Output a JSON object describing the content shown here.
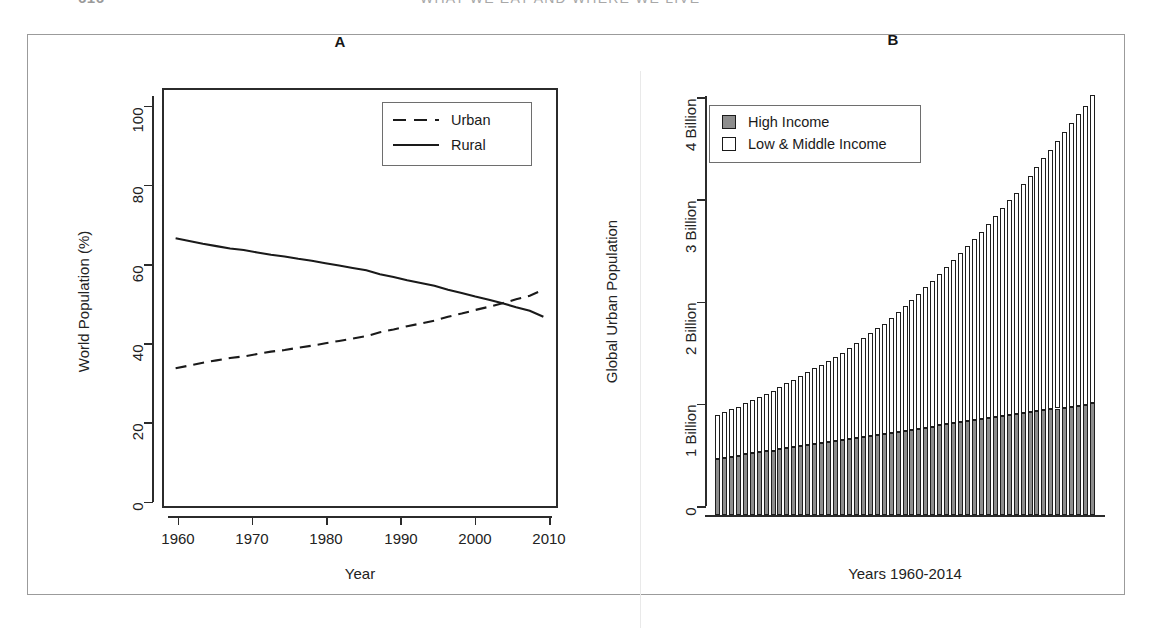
{
  "page_header": {
    "folio": "616",
    "running_title": "WHAT WE EAT AND WHERE WE LIVE"
  },
  "figure": {
    "panels": [
      {
        "id": "A",
        "title": "A",
        "xlabel": "Year",
        "ylabel": "World Population (%)"
      },
      {
        "id": "B",
        "title": "B",
        "xlabel": "Years 1960-2014",
        "ylabel": "Global Urban Population"
      }
    ]
  },
  "chart_data": [
    {
      "type": "line",
      "panel": "A",
      "title": "A",
      "xlabel": "Year",
      "ylabel": "World Population (%)",
      "xlim": [
        1958,
        2016
      ],
      "ylim": [
        0,
        104
      ],
      "xticks": [
        1960,
        1970,
        1980,
        1990,
        2000,
        2010
      ],
      "yticks": [
        0,
        20,
        40,
        60,
        80,
        100
      ],
      "grid": false,
      "legend_position": "top-right",
      "legend": [
        "Urban",
        "Rural"
      ],
      "x": [
        1960,
        1962,
        1964,
        1966,
        1968,
        1970,
        1972,
        1974,
        1976,
        1978,
        1980,
        1982,
        1984,
        1986,
        1988,
        1990,
        1992,
        1994,
        1996,
        1998,
        2000,
        2002,
        2004,
        2006,
        2008,
        2010,
        2012,
        2014
      ],
      "series": [
        {
          "name": "Urban",
          "style": "dashed",
          "values": [
            33.6,
            34.3,
            35.0,
            35.6,
            36.2,
            36.6,
            37.2,
            37.8,
            38.2,
            38.8,
            39.3,
            39.9,
            40.5,
            41.1,
            41.7,
            42.7,
            43.4,
            44.2,
            44.9,
            45.6,
            46.6,
            47.4,
            48.3,
            49.1,
            50.0,
            51.0,
            51.9,
            53.4
          ]
        },
        {
          "name": "Rural",
          "style": "solid",
          "values": [
            66.4,
            65.7,
            65.0,
            64.4,
            63.8,
            63.4,
            62.8,
            62.2,
            61.8,
            61.2,
            60.7,
            60.1,
            59.5,
            58.9,
            58.3,
            57.3,
            56.6,
            55.8,
            55.1,
            54.4,
            53.4,
            52.6,
            51.7,
            50.9,
            50.0,
            49.0,
            48.1,
            46.6
          ]
        }
      ],
      "crossover": {
        "year": 2007,
        "value": 50.0
      }
    },
    {
      "type": "bar",
      "subtype": "stacked",
      "panel": "B",
      "title": "B",
      "xlabel": "Years 1960-2014",
      "ylabel": "Global Urban Population",
      "ylim": [
        0,
        4.35
      ],
      "yticks": [
        0,
        1,
        2,
        3,
        4
      ],
      "ytick_labels": [
        "0",
        "1 Billion",
        "2 Billion",
        "3 Billion",
        "4 Billion"
      ],
      "grid": false,
      "legend_position": "top-left",
      "categories": [
        1960,
        1961,
        1962,
        1963,
        1964,
        1965,
        1966,
        1967,
        1968,
        1969,
        1970,
        1971,
        1972,
        1973,
        1974,
        1975,
        1976,
        1977,
        1978,
        1979,
        1980,
        1981,
        1982,
        1983,
        1984,
        1985,
        1986,
        1987,
        1988,
        1989,
        1990,
        1991,
        1992,
        1993,
        1994,
        1995,
        1996,
        1997,
        1998,
        1999,
        2000,
        2001,
        2002,
        2003,
        2004,
        2005,
        2006,
        2007,
        2008,
        2009,
        2010,
        2011,
        2012,
        2013,
        2014
      ],
      "series": [
        {
          "name": "High Income",
          "color": "#8d8d8d",
          "values": [
            0.57,
            0.58,
            0.59,
            0.6,
            0.62,
            0.63,
            0.64,
            0.65,
            0.66,
            0.68,
            0.69,
            0.7,
            0.71,
            0.72,
            0.73,
            0.74,
            0.75,
            0.76,
            0.77,
            0.78,
            0.79,
            0.8,
            0.81,
            0.82,
            0.83,
            0.84,
            0.85,
            0.86,
            0.87,
            0.88,
            0.89,
            0.9,
            0.92,
            0.93,
            0.94,
            0.95,
            0.96,
            0.97,
            0.98,
            0.99,
            1.0,
            1.01,
            1.02,
            1.03,
            1.04,
            1.05,
            1.06,
            1.07,
            1.08,
            1.09,
            1.1,
            1.11,
            1.12,
            1.13,
            1.15
          ]
        },
        {
          "name": "Low & Middle Income",
          "color": "#ffffff",
          "values": [
            0.45,
            0.47,
            0.49,
            0.51,
            0.53,
            0.55,
            0.57,
            0.59,
            0.61,
            0.63,
            0.66,
            0.68,
            0.71,
            0.74,
            0.77,
            0.8,
            0.83,
            0.86,
            0.89,
            0.93,
            0.97,
            1.01,
            1.05,
            1.09,
            1.13,
            1.18,
            1.23,
            1.28,
            1.33,
            1.38,
            1.44,
            1.49,
            1.55,
            1.61,
            1.67,
            1.73,
            1.79,
            1.86,
            1.92,
            1.99,
            2.06,
            2.13,
            2.2,
            2.27,
            2.35,
            2.42,
            2.5,
            2.58,
            2.66,
            2.74,
            2.82,
            2.9,
            2.98,
            3.06,
            3.15
          ]
        }
      ],
      "totals": [
        1.02,
        1.05,
        1.08,
        1.11,
        1.15,
        1.18,
        1.21,
        1.24,
        1.27,
        1.31,
        1.35,
        1.38,
        1.42,
        1.46,
        1.5,
        1.54,
        1.58,
        1.62,
        1.66,
        1.71,
        1.76,
        1.81,
        1.86,
        1.91,
        1.96,
        2.02,
        2.08,
        2.14,
        2.2,
        2.26,
        2.33,
        2.39,
        2.47,
        2.54,
        2.61,
        2.68,
        2.75,
        2.83,
        2.9,
        2.98,
        3.06,
        3.14,
        3.22,
        3.3,
        3.39,
        3.47,
        3.56,
        3.65,
        3.74,
        3.83,
        3.92,
        4.01,
        4.1,
        4.19,
        4.3
      ]
    }
  ],
  "colors": {
    "high_income_fill": "#8d8d8d",
    "low_middle_income_fill": "#ffffff",
    "line_color": "#1a1a1a",
    "frame_border": "#9b9b9b"
  }
}
